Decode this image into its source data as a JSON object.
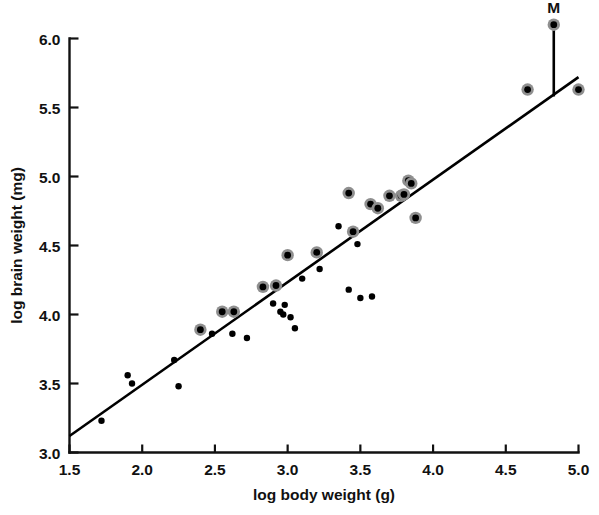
{
  "chart_data": {
    "type": "scatter",
    "title": "",
    "xlabel": "log body weight (g)",
    "ylabel": "log brain weight (mg)",
    "xlim": [
      1.5,
      5.0
    ],
    "ylim": [
      3.0,
      6.0
    ],
    "xticks": [
      "1.5",
      "2.0",
      "2.5",
      "3.0",
      "3.5",
      "4.0",
      "4.5",
      "5.0"
    ],
    "yticks": [
      "3.0",
      "3.5",
      "4.0",
      "4.5",
      "5.0",
      "5.5",
      "6.0"
    ],
    "grid": false,
    "legend": null,
    "annotations": [
      {
        "text": "M",
        "x": 4.83,
        "y": 6.1,
        "note": "labelled outlier point joined to fitted line by vertical leader"
      }
    ],
    "fit_line": {
      "style": "solid",
      "x_start": 1.5,
      "y_start": 3.12,
      "x_end": 5.0,
      "y_end": 5.72
    },
    "leader_line": {
      "x": 4.83,
      "y_top": 6.06,
      "y_bottom": 5.58
    },
    "series": [
      {
        "name": "ringed",
        "marker": "dot-with-grey-ring",
        "points": [
          [
            2.4,
            3.89
          ],
          [
            2.55,
            4.02
          ],
          [
            2.63,
            4.02
          ],
          [
            2.83,
            4.2
          ],
          [
            2.92,
            4.21
          ],
          [
            3.0,
            4.43
          ],
          [
            3.2,
            4.45
          ],
          [
            3.42,
            4.88
          ],
          [
            3.45,
            4.6
          ],
          [
            3.57,
            4.8
          ],
          [
            3.62,
            4.77
          ],
          [
            3.7,
            4.86
          ],
          [
            3.78,
            4.86
          ],
          [
            3.8,
            4.87
          ],
          [
            3.83,
            4.97
          ],
          [
            3.85,
            4.95
          ],
          [
            3.88,
            4.7
          ],
          [
            4.65,
            5.63
          ],
          [
            4.83,
            6.1
          ],
          [
            5.0,
            5.63
          ]
        ]
      },
      {
        "name": "plain",
        "marker": "dot",
        "points": [
          [
            1.72,
            3.23
          ],
          [
            1.9,
            3.56
          ],
          [
            1.93,
            3.5
          ],
          [
            2.22,
            3.67
          ],
          [
            2.25,
            3.48
          ],
          [
            2.48,
            3.86
          ],
          [
            2.62,
            3.86
          ],
          [
            2.72,
            3.83
          ],
          [
            2.9,
            4.08
          ],
          [
            2.95,
            4.02
          ],
          [
            2.97,
            4.0
          ],
          [
            2.98,
            4.07
          ],
          [
            3.02,
            3.98
          ],
          [
            3.05,
            3.9
          ],
          [
            3.1,
            4.26
          ],
          [
            3.22,
            4.33
          ],
          [
            3.35,
            4.64
          ],
          [
            3.42,
            4.18
          ],
          [
            3.48,
            4.51
          ],
          [
            3.5,
            4.12
          ],
          [
            3.58,
            4.13
          ]
        ]
      }
    ]
  }
}
